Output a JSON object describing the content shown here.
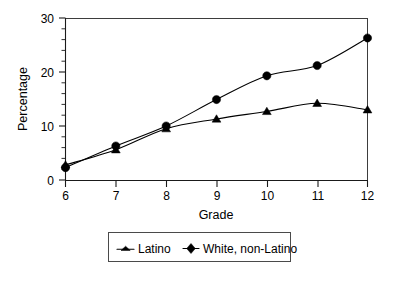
{
  "chart_data": {
    "type": "line",
    "title": "",
    "xlabel": "Grade",
    "ylabel": "Percentage",
    "x": [
      6,
      7,
      8,
      9,
      10,
      11,
      12
    ],
    "categories": [
      "6",
      "7",
      "8",
      "9",
      "10",
      "11",
      "12"
    ],
    "xlim": [
      6,
      12
    ],
    "ylim": [
      0,
      30
    ],
    "y_ticks": [
      0,
      10,
      20,
      30
    ],
    "y_tick_labels": [
      "0",
      "10",
      "20",
      "30"
    ],
    "y_minor_tick_interval": 2,
    "x_ticks": [
      6,
      7,
      8,
      9,
      10,
      11,
      12
    ],
    "x_tick_labels": [
      "6",
      "7",
      "8",
      "9",
      "10",
      "11",
      "12"
    ],
    "grid": false,
    "legend_position": "bottom-center",
    "smoothing": "spline",
    "series": [
      {
        "name": "Latino",
        "marker": "triangle",
        "color": "#000000",
        "values": [
          2.8,
          5.6,
          9.5,
          11.3,
          12.7,
          14.2,
          13.0
        ]
      },
      {
        "name": "White, non-Latino",
        "marker": "circle",
        "color": "#000000",
        "values": [
          2.3,
          6.3,
          10.0,
          14.9,
          19.3,
          21.2,
          26.3
        ]
      }
    ]
  },
  "axes": {
    "y_title": "Percentage",
    "x_title": "Grade",
    "y_tick_0": "0",
    "y_tick_1": "10",
    "y_tick_2": "20",
    "y_tick_3": "30",
    "x_tick_0": "6",
    "x_tick_1": "7",
    "x_tick_2": "8",
    "x_tick_3": "9",
    "x_tick_4": "10",
    "x_tick_5": "11",
    "x_tick_6": "12"
  },
  "legend": {
    "entries": [
      {
        "label": "Latino",
        "marker": "triangle-marker-icon"
      },
      {
        "label": "White, non-Latino",
        "marker": "circle-marker-icon"
      }
    ],
    "entry_0_label": "Latino",
    "entry_1_label": "White, non-Latino"
  },
  "colors": {
    "series": "#000000",
    "axis": "#1a1a1a",
    "frame": "#3d3d3d",
    "background": "#ffffff"
  }
}
